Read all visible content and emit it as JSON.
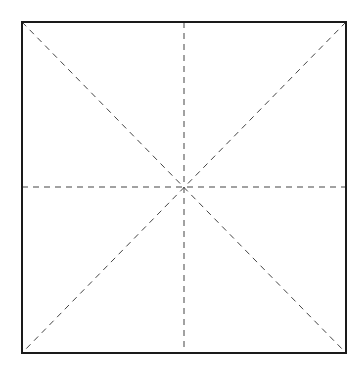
{
  "diagram": {
    "type": "square-with-guides",
    "canvas": {
      "width": 363,
      "height": 374,
      "background": "#ffffff"
    },
    "square": {
      "x1": 22,
      "y1": 22,
      "x2": 346,
      "y2": 353,
      "stroke": "#1a1a1a",
      "stroke_width": 2
    },
    "guides": {
      "stroke": "#444444",
      "stroke_width": 1,
      "dash": "6,5",
      "lines": [
        {
          "name": "diagonal-tl-br",
          "x1": 22,
          "y1": 22,
          "x2": 346,
          "y2": 353
        },
        {
          "name": "diagonal-tr-bl",
          "x1": 346,
          "y1": 22,
          "x2": 22,
          "y2": 353
        },
        {
          "name": "vertical-center",
          "x1": 184,
          "y1": 22,
          "x2": 184,
          "y2": 353
        },
        {
          "name": "horizontal-center",
          "x1": 22,
          "y1": 187,
          "x2": 346,
          "y2": 187
        }
      ]
    }
  }
}
